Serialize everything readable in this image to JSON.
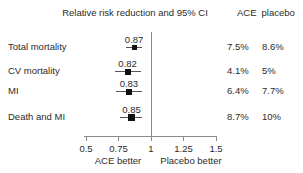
{
  "header": {
    "ace_col": "ACE",
    "placebo_col": "placebo"
  },
  "chart_data": {
    "type": "forest",
    "title": "Relative risk reduction and 95% CI",
    "x_axis": {
      "range": [
        0.5,
        1.5
      ],
      "ticks": [
        0.5,
        0.75,
        1,
        1.25,
        1.5
      ],
      "tick_labels": [
        "0.5",
        "0.75",
        "1",
        "1.25",
        "1.5"
      ],
      "reference_line": 1,
      "left_label": "ACE better",
      "right_label": "Placebo better"
    },
    "rows": [
      {
        "label": "Total mortality",
        "rr": 0.87,
        "rr_label": "0.87",
        "ci_low": 0.81,
        "ci_high": 0.93,
        "ace_pct": "7.5%",
        "placebo_pct": "8.6%",
        "marker_px": 5
      },
      {
        "label": "CV mortality",
        "rr": 0.82,
        "rr_label": "0.82",
        "ci_low": 0.72,
        "ci_high": 0.92,
        "ace_pct": "4.1%",
        "placebo_pct": "5%",
        "marker_px": 6
      },
      {
        "label": "MI",
        "rr": 0.83,
        "rr_label": "0.83",
        "ci_low": 0.73,
        "ci_high": 0.93,
        "ace_pct": "6.4%",
        "placebo_pct": "7.7%",
        "marker_px": 6
      },
      {
        "label": "Death and MI",
        "rr": 0.85,
        "rr_label": "0.85",
        "ci_low": 0.76,
        "ci_high": 0.93,
        "ace_pct": "8.7%",
        "placebo_pct": "10%",
        "marker_px": 7
      }
    ],
    "colors": {
      "text": "#2b2b2b",
      "axis_line": "#8a8a8a",
      "ci_line": "#555555",
      "marker": "#101010",
      "background": "#ffffff"
    }
  }
}
